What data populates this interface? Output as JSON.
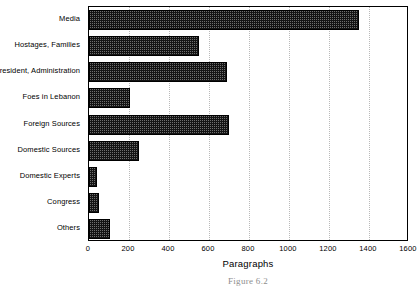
{
  "chart_data": {
    "type": "bar",
    "orientation": "horizontal",
    "title": "",
    "xlabel": "Paragraphs",
    "ylabel": "",
    "xlim": [
      0,
      1600
    ],
    "xticks": [
      0,
      200,
      400,
      600,
      800,
      1000,
      1200,
      1400,
      1600
    ],
    "xtick_labels": [
      "0",
      "200",
      "400",
      "600",
      "800",
      "1000",
      "1200",
      "1400",
      "1600"
    ],
    "grid": "vertical-dotted",
    "legend": "none",
    "categories": [
      "Media",
      "Hostages, Families",
      "President, Administration",
      "Foes in Lebanon",
      "Foreign Sources",
      "Domestic Sources",
      "Domestic Experts",
      "Congress",
      "Others"
    ],
    "values": [
      1350,
      550,
      690,
      205,
      700,
      250,
      40,
      50,
      105
    ],
    "bar_color": "#141414",
    "grid_color": "#b9b9b9",
    "axis_color": "#000000"
  },
  "caption": {
    "text": "Figure 6.2"
  }
}
